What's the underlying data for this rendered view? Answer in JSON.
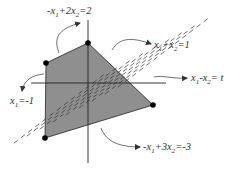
{
  "diagram": {
    "colors": {
      "region_fill": "#8f8f8f",
      "stroke": "#222222",
      "dash": "#333333",
      "text": "#333333",
      "vertex": "#000000"
    },
    "axes": {
      "horizontal": "x1",
      "vertical": "x2"
    },
    "constraints": [
      {
        "id": "c-top-left",
        "label_parts": [
          "-x",
          "1",
          "+2x",
          "2",
          "=2"
        ],
        "text": "-x1+2x2=2"
      },
      {
        "id": "c-top-right",
        "label_parts": [
          "x",
          "1",
          "+x",
          "2",
          "=1"
        ],
        "text": "x1+x2=1"
      },
      {
        "id": "c-objective",
        "label_parts": [
          "x",
          "1",
          "-x",
          "2",
          "= t"
        ],
        "text": "x1-x2 = t"
      },
      {
        "id": "c-left",
        "label_parts": [
          "x",
          "1",
          "=-1",
          "",
          ""
        ],
        "text": "x1=-1"
      },
      {
        "id": "c-bottom",
        "label_parts": [
          "-x",
          "1",
          "+3x",
          "2",
          "=-3"
        ],
        "text": "-x1+3x2=-3"
      }
    ],
    "vertices": [
      {
        "name": "vertex-top",
        "x1": 0,
        "x2": 1
      },
      {
        "name": "vertex-upper-left",
        "x1": -1,
        "x2": 0.5
      },
      {
        "name": "vertex-lower-left",
        "x1": -1,
        "x2": -1.33
      },
      {
        "name": "vertex-right",
        "x1": 1.5,
        "x2": -0.5
      }
    ],
    "objective_level_lines": 9
  }
}
